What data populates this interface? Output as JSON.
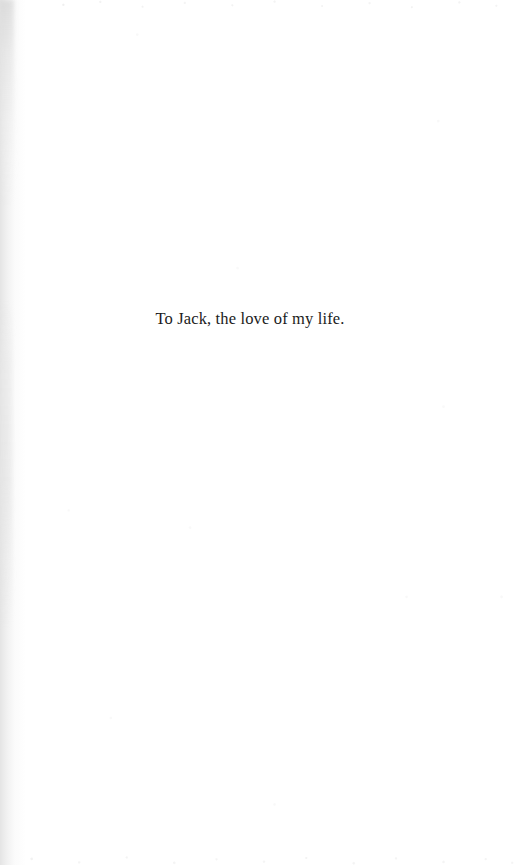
{
  "page": {
    "kind": "book-dedication-page",
    "background_color": "#ffffff",
    "width": 528,
    "height": 865
  },
  "content": {
    "dedication_text": "To Jack, the love of my life.",
    "text_color": "#1b1b1b",
    "alignment": "center"
  },
  "scan_artifacts": {
    "gutter_shadow_color": "#e4e4e4",
    "speckle_color": "#cccccc"
  }
}
